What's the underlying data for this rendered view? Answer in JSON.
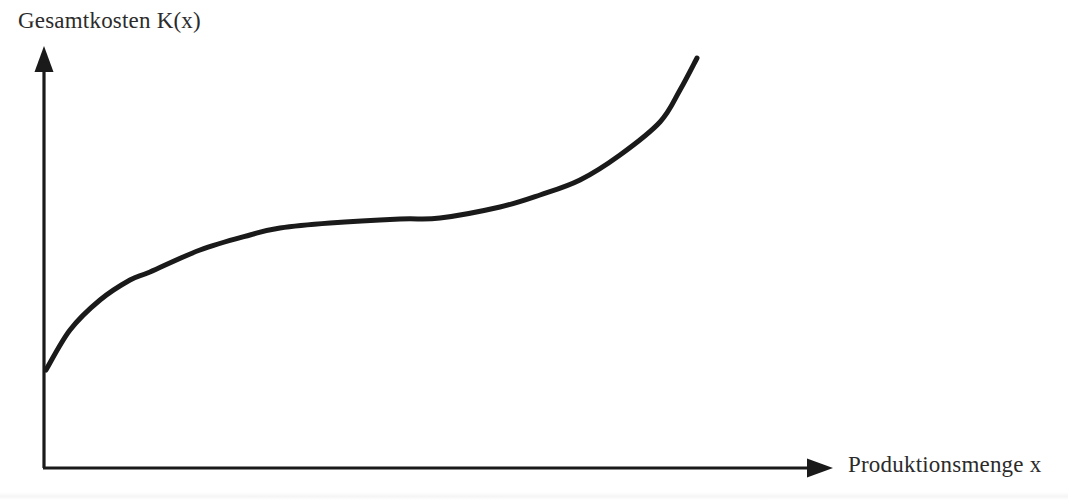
{
  "figure": {
    "background_color": "#ffffff",
    "ink_color": "#1a1a1a",
    "text_color": "#2b2b2b",
    "width": 1068,
    "height": 500
  },
  "labels": {
    "y_axis": "Gesamtkosten K(x)",
    "x_axis": "Produktionsmenge x"
  },
  "chart_data": {
    "type": "line",
    "title": "",
    "subtitle": "",
    "xlabel": "Produktionsmenge x",
    "ylabel": "Gesamtkosten K(x)",
    "grid": false,
    "legend": false,
    "legend_position": "none",
    "axis_style": "arrow-headed, no tick marks, no tick labels",
    "xlim": [
      0,
      1
    ],
    "ylim": [
      0,
      1
    ],
    "annotations": [],
    "series": [
      {
        "name": "K(x)",
        "color": "#1a1a1a",
        "line_width": 5,
        "points_px": [
          [
            46,
            370
          ],
          [
            70,
            330
          ],
          [
            100,
            300
          ],
          [
            130,
            280
          ],
          [
            150,
            272
          ],
          [
            200,
            250
          ],
          [
            250,
            235
          ],
          [
            280,
            228
          ],
          [
            330,
            223
          ],
          [
            400,
            219
          ],
          [
            440,
            218
          ],
          [
            500,
            207
          ],
          [
            540,
            195
          ],
          [
            580,
            180
          ],
          [
            620,
            155
          ],
          [
            660,
            122
          ],
          [
            680,
            90
          ],
          [
            697,
            58
          ]
        ],
        "x": [
          0.0,
          0.03,
          0.07,
          0.11,
          0.13,
          0.19,
          0.26,
          0.3,
          0.36,
          0.45,
          0.5,
          0.58,
          0.63,
          0.68,
          0.73,
          0.78,
          0.8,
          0.83
        ],
        "values": [
          0.23,
          0.33,
          0.4,
          0.45,
          0.47,
          0.52,
          0.55,
          0.57,
          0.58,
          0.59,
          0.6,
          0.62,
          0.65,
          0.69,
          0.74,
          0.82,
          0.9,
          0.98
        ]
      }
    ],
    "axes_px": {
      "origin": [
        44,
        468
      ],
      "y_axis_top": [
        44,
        48
      ],
      "x_axis_right": [
        832,
        468
      ]
    }
  }
}
